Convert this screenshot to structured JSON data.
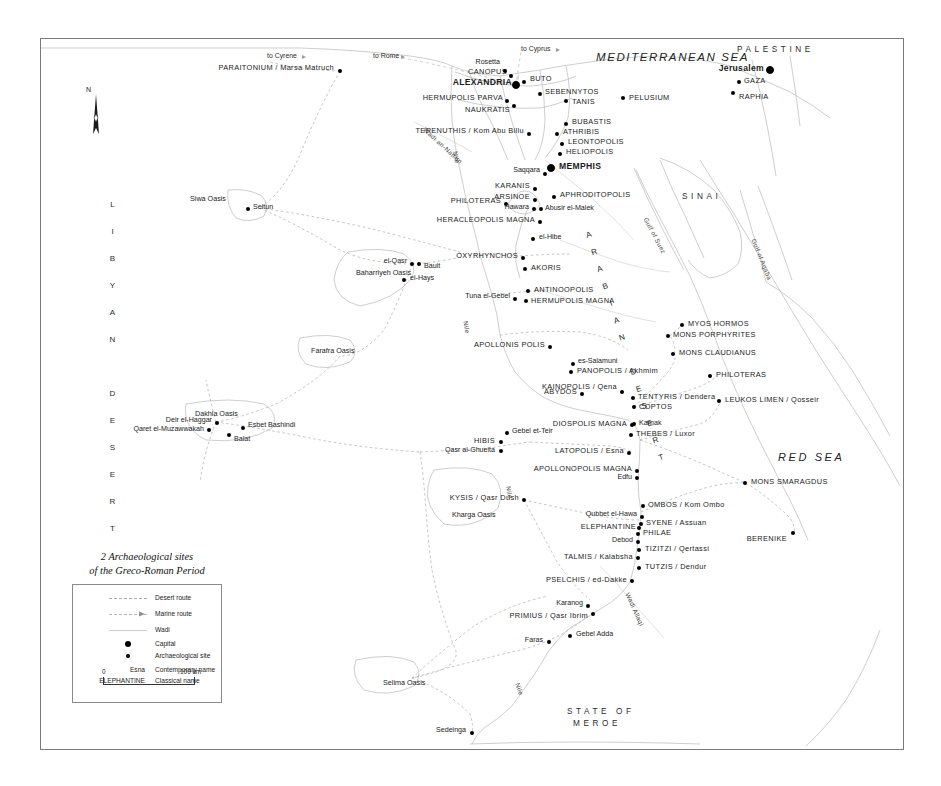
{
  "legend": {
    "title_line1": "2 Archaeological sites",
    "title_line2": "of the Greco-Roman Period",
    "items": [
      {
        "symbol": "dashed-line",
        "label": "Desert route"
      },
      {
        "symbol": "arrow-line",
        "label": "Marine route"
      },
      {
        "symbol": "thin-line",
        "label": "Wadi"
      },
      {
        "symbol": "large-dot",
        "label": "Capital"
      },
      {
        "symbol": "small-dot",
        "label": "Archaeological site"
      }
    ],
    "name_examples": [
      {
        "sample": "Esna",
        "label": "Contemporary name"
      },
      {
        "sample": "ELEPHANTINE",
        "label": "Classical name"
      }
    ],
    "scale": {
      "start": "0",
      "end": "100 km"
    }
  },
  "compass": {
    "north_label": "N"
  },
  "seas": [
    {
      "name": "MEDITERRANEAN SEA",
      "x": 596,
      "y": 52,
      "cls": "sea"
    },
    {
      "name": "RED SEA",
      "x": 778,
      "y": 452,
      "cls": "redsea"
    }
  ],
  "regions": [
    {
      "name": "LIBYAN DESERT",
      "x": 108,
      "y": 200,
      "orientation": "vertical"
    },
    {
      "name": "ARABIAN DESERT",
      "x": 583,
      "y": 232,
      "orientation": "diagonal"
    },
    {
      "name": "SINAI",
      "x": 682,
      "y": 193,
      "orientation": "horizontal"
    },
    {
      "name": "PALESTINE",
      "x": 737,
      "y": 46,
      "orientation": "horizontal"
    },
    {
      "name": "STATE OF",
      "x": 567,
      "y": 708,
      "orientation": "horizontal"
    },
    {
      "name": "MEROE",
      "x": 573,
      "y": 720,
      "orientation": "horizontal"
    }
  ],
  "gulfs": [
    {
      "name": "Gulf of Suez",
      "x": 645,
      "y": 215,
      "rot": 62
    },
    {
      "name": "Gulf of Aqaba",
      "x": 753,
      "y": 236,
      "rot": 68
    }
  ],
  "rivers": [
    {
      "name": "Nile",
      "x": 455,
      "y": 148,
      "rot": 82
    },
    {
      "name": "Nile",
      "x": 465,
      "y": 318,
      "rot": 80
    },
    {
      "name": "Nile",
      "x": 508,
      "y": 483,
      "rot": 82
    },
    {
      "name": "Nile",
      "x": 517,
      "y": 680,
      "rot": 72
    },
    {
      "name": "Wadi Allaqi",
      "x": 627,
      "y": 590,
      "rot": 66
    },
    {
      "name": "Wadi an-Natrun",
      "x": 424,
      "y": 126,
      "rot": 42
    }
  ],
  "routes": [
    {
      "label": "to Cyrene",
      "x": 267,
      "y": 53
    },
    {
      "label": "to Rome",
      "x": 373,
      "y": 53
    },
    {
      "label": "to Cyprus",
      "x": 521,
      "y": 46
    }
  ],
  "oases": [
    {
      "label": "Siwa Oasis",
      "x": 190,
      "y": 195
    },
    {
      "label": "Baharriyeh Oasis",
      "x": 356,
      "y": 269
    },
    {
      "label": "Farafra Oasis",
      "x": 311,
      "y": 347
    },
    {
      "label": "Dakhla Oasis",
      "x": 195,
      "y": 410
    },
    {
      "label": "Kharga Oasis",
      "x": 452,
      "y": 511
    },
    {
      "label": "Selima Oasis",
      "x": 383,
      "y": 679
    }
  ],
  "places": [
    {
      "name": "PARAITONIUM / Marsa Matruch",
      "cls": "classical",
      "anchor": "right",
      "tx": 334,
      "ty": 68,
      "dx": 340,
      "dy": 71,
      "size": "small"
    },
    {
      "name": "ALEXANDRIA",
      "cls": "capital",
      "anchor": "right",
      "tx": 512,
      "ty": 82,
      "dx": 516,
      "dy": 85,
      "size": "big"
    },
    {
      "name": "CANOPUS",
      "cls": "classical",
      "anchor": "right",
      "tx": 507,
      "ty": 72,
      "dx": 511,
      "dy": 76,
      "size": "small"
    },
    {
      "name": "Rosetta",
      "cls": "modern",
      "anchor": "right",
      "tx": 500,
      "ty": 63,
      "dx": 505,
      "dy": 71,
      "size": "small"
    },
    {
      "name": "BUTO",
      "cls": "classical",
      "anchor": "left",
      "tx": 530,
      "ty": 79,
      "dx": 524,
      "dy": 82,
      "size": "small"
    },
    {
      "name": "HERMUPOLIS PARVA",
      "cls": "classical",
      "anchor": "right",
      "tx": 503,
      "ty": 98,
      "dx": 507,
      "dy": 101,
      "size": "small"
    },
    {
      "name": "NAUKRATIS",
      "cls": "classical",
      "anchor": "right",
      "tx": 510,
      "ty": 110,
      "dx": 514,
      "dy": 106,
      "size": "small"
    },
    {
      "name": "SEBENNYTOS",
      "cls": "classical",
      "anchor": "left",
      "tx": 545,
      "ty": 92,
      "dx": 540,
      "dy": 94,
      "size": "small"
    },
    {
      "name": "TANIS",
      "cls": "classical",
      "anchor": "left",
      "tx": 572,
      "ty": 102,
      "dx": 566,
      "dy": 101,
      "size": "small"
    },
    {
      "name": "PELUSIUM",
      "cls": "classical",
      "anchor": "left",
      "tx": 629,
      "ty": 98,
      "dx": 623,
      "dy": 98,
      "size": "small"
    },
    {
      "name": "GAZA",
      "cls": "classical",
      "anchor": "left",
      "tx": 744,
      "ty": 81,
      "dx": 739,
      "dy": 82,
      "size": "small"
    },
    {
      "name": "RAPHIA",
      "cls": "classical",
      "anchor": "left",
      "tx": 739,
      "ty": 97,
      "dx": 733,
      "dy": 93,
      "size": "small"
    },
    {
      "name": "Jerusalem",
      "cls": "capital",
      "anchor": "right",
      "tx": 764,
      "ty": 68,
      "dx": 770,
      "dy": 70,
      "size": "big"
    },
    {
      "name": "BUBASTIS",
      "cls": "classical",
      "anchor": "left",
      "tx": 572,
      "ty": 122,
      "dx": 566,
      "dy": 124,
      "size": "small"
    },
    {
      "name": "ATHRIBIS",
      "cls": "classical",
      "anchor": "left",
      "tx": 563,
      "ty": 132,
      "dx": 557,
      "dy": 134,
      "size": "small"
    },
    {
      "name": "LEONTOPOLIS",
      "cls": "classical",
      "anchor": "left",
      "tx": 568,
      "ty": 142,
      "dx": 562,
      "dy": 144,
      "size": "small"
    },
    {
      "name": "HELIOPOLIS",
      "cls": "classical",
      "anchor": "left",
      "tx": 566,
      "ty": 152,
      "dx": 560,
      "dy": 154,
      "size": "small"
    },
    {
      "name": "TERENUTHIS / Kom Abu Billu",
      "cls": "classical",
      "anchor": "right",
      "tx": 524,
      "ty": 131,
      "dx": 529,
      "dy": 134,
      "size": "small"
    },
    {
      "name": "MEMPHIS",
      "cls": "capital",
      "anchor": "left",
      "tx": 559,
      "ty": 166,
      "dx": 551,
      "dy": 168,
      "size": "big"
    },
    {
      "name": "Saqqara",
      "cls": "modern",
      "anchor": "right",
      "tx": 540,
      "ty": 171,
      "dx": 545,
      "dy": 174,
      "size": "small"
    },
    {
      "name": "KARANIS",
      "cls": "classical",
      "anchor": "right",
      "tx": 530,
      "ty": 186,
      "dx": 535,
      "dy": 189,
      "size": "small"
    },
    {
      "name": "APHRODITOPOLIS",
      "cls": "classical",
      "anchor": "left",
      "tx": 560,
      "ty": 195,
      "dx": 554,
      "dy": 197,
      "size": "small"
    },
    {
      "name": "ARSINOE",
      "cls": "classical",
      "anchor": "right",
      "tx": 530,
      "ty": 197,
      "dx": 535,
      "dy": 200,
      "size": "small"
    },
    {
      "name": "PHILOTERAS",
      "cls": "classical",
      "anchor": "right",
      "tx": 501,
      "ty": 201,
      "dx": 506,
      "dy": 204,
      "size": "small"
    },
    {
      "name": "Hawara",
      "cls": "modern",
      "anchor": "right",
      "tx": 529,
      "ty": 208,
      "dx": 534,
      "dy": 209,
      "size": "small"
    },
    {
      "name": "Abusir el-Malek",
      "cls": "modern",
      "anchor": "left",
      "tx": 545,
      "ty": 209,
      "dx": 541,
      "dy": 209,
      "size": "small"
    },
    {
      "name": "HERACLEOPOLIS MAGNA",
      "cls": "classical",
      "anchor": "right",
      "tx": 535,
      "ty": 220,
      "dx": 540,
      "dy": 222,
      "size": "small"
    },
    {
      "name": "el-Hibe",
      "cls": "modern",
      "anchor": "left",
      "tx": 539,
      "ty": 238,
      "dx": 533,
      "dy": 239,
      "size": "small"
    },
    {
      "name": "OXYRHYNCHOS",
      "cls": "classical",
      "anchor": "right",
      "tx": 518,
      "ty": 256,
      "dx": 523,
      "dy": 258,
      "size": "small"
    },
    {
      "name": "AKORIS",
      "cls": "classical",
      "anchor": "left",
      "tx": 531,
      "ty": 268,
      "dx": 525,
      "dy": 269,
      "size": "small"
    },
    {
      "name": "ANTINOOPOLIS",
      "cls": "classical",
      "anchor": "left",
      "tx": 534,
      "ty": 290,
      "dx": 528,
      "dy": 291,
      "size": "small"
    },
    {
      "name": "HERMUPOLIS MAGNA",
      "cls": "classical",
      "anchor": "left",
      "tx": 531,
      "ty": 301,
      "dx": 526,
      "dy": 301,
      "size": "small"
    },
    {
      "name": "Tuna el-Gebel",
      "cls": "modern",
      "anchor": "right",
      "tx": 510,
      "ty": 297,
      "dx": 515,
      "dy": 299,
      "size": "small"
    },
    {
      "name": "el-Qasr",
      "cls": "modern",
      "anchor": "right",
      "tx": 407,
      "ty": 262,
      "dx": 412,
      "dy": 264,
      "size": "small"
    },
    {
      "name": "Bauit",
      "cls": "modern",
      "anchor": "left",
      "tx": 424,
      "ty": 267,
      "dx": 419,
      "dy": 264,
      "size": "small"
    },
    {
      "name": "el-Hays",
      "cls": "modern",
      "anchor": "left",
      "tx": 410,
      "ty": 279,
      "dx": 404,
      "dy": 280,
      "size": "small"
    },
    {
      "name": "APOLLONIS POLIS",
      "cls": "classical",
      "anchor": "right",
      "tx": 545,
      "ty": 345,
      "dx": 550,
      "dy": 347,
      "size": "small"
    },
    {
      "name": "es-Salamuni",
      "cls": "modern",
      "anchor": "left",
      "tx": 578,
      "ty": 362,
      "dx": 573,
      "dy": 364,
      "size": "small"
    },
    {
      "name": "PANOPOLIS / Akhmim",
      "cls": "classical",
      "anchor": "left",
      "tx": 577,
      "ty": 371,
      "dx": 571,
      "dy": 372,
      "size": "small"
    },
    {
      "name": "ABYDOS",
      "cls": "classical",
      "anchor": "right",
      "tx": 577,
      "ty": 392,
      "dx": 582,
      "dy": 394,
      "size": "small"
    },
    {
      "name": "KAINOPOLIS / Qena",
      "cls": "classical",
      "anchor": "right",
      "tx": 617,
      "ty": 387,
      "dx": 622,
      "dy": 392,
      "size": "small"
    },
    {
      "name": "TENTYRIS / Dendera",
      "cls": "classical",
      "anchor": "left",
      "tx": 638,
      "ty": 397,
      "dx": 633,
      "dy": 398,
      "size": "small"
    },
    {
      "name": "COPTOS",
      "cls": "classical",
      "anchor": "left",
      "tx": 639,
      "ty": 407,
      "dx": 634,
      "dy": 407,
      "size": "small"
    },
    {
      "name": "DIOSPOLIS MAGNA",
      "cls": "classical",
      "anchor": "right",
      "tx": 627,
      "ty": 424,
      "dx": 632,
      "dy": 425,
      "size": "small"
    },
    {
      "name": "Karnak",
      "cls": "modern",
      "anchor": "left",
      "tx": 639,
      "ty": 424,
      "dx": 634,
      "dy": 424,
      "size": "small"
    },
    {
      "name": "THEBES / Luxor",
      "cls": "classical",
      "anchor": "left",
      "tx": 636,
      "ty": 434,
      "dx": 631,
      "dy": 435,
      "size": "small"
    },
    {
      "name": "LATOPOLIS / Esna",
      "cls": "classical",
      "anchor": "right",
      "tx": 624,
      "ty": 451,
      "dx": 629,
      "dy": 453,
      "size": "small"
    },
    {
      "name": "APOLLONOPOLIS MAGNA",
      "cls": "classical",
      "anchor": "right",
      "tx": 632,
      "ty": 469,
      "dx": 637,
      "dy": 471,
      "size": "small"
    },
    {
      "name": "Edfu",
      "cls": "modern",
      "anchor": "right",
      "tx": 632,
      "ty": 478,
      "dx": 637,
      "dy": 478,
      "size": "small"
    },
    {
      "name": "Gebel et-Teir",
      "cls": "modern",
      "anchor": "left",
      "tx": 512,
      "ty": 432,
      "dx": 507,
      "dy": 433,
      "size": "small"
    },
    {
      "name": "HIBIS",
      "cls": "classical",
      "anchor": "right",
      "tx": 495,
      "ty": 441,
      "dx": 501,
      "dy": 442,
      "size": "small"
    },
    {
      "name": "Qasr al-Ghueita",
      "cls": "modern",
      "anchor": "right",
      "tx": 495,
      "ty": 451,
      "dx": 501,
      "dy": 451,
      "size": "small"
    },
    {
      "name": "KYSIS / Qasr Dush",
      "cls": "classical",
      "anchor": "right",
      "tx": 519,
      "ty": 498,
      "dx": 524,
      "dy": 500,
      "size": "small"
    },
    {
      "name": "Deir el-Haggar",
      "cls": "modern",
      "anchor": "right",
      "tx": 212,
      "ty": 421,
      "dx": 217,
      "dy": 423,
      "size": "small"
    },
    {
      "name": "Qaret el-Muzawwakah",
      "cls": "modern",
      "anchor": "right",
      "tx": 204,
      "ty": 430,
      "dx": 209,
      "dy": 430,
      "size": "small"
    },
    {
      "name": "Esbet Bashindi",
      "cls": "modern",
      "anchor": "left",
      "tx": 248,
      "ty": 426,
      "dx": 243,
      "dy": 428,
      "size": "small"
    },
    {
      "name": "Balat",
      "cls": "modern",
      "anchor": "left",
      "tx": 234,
      "ty": 440,
      "dx": 229,
      "dy": 435,
      "size": "small"
    },
    {
      "name": "Seitun",
      "cls": "modern",
      "anchor": "left",
      "tx": 253,
      "ty": 208,
      "dx": 248,
      "dy": 209,
      "size": "small"
    },
    {
      "name": "MYOS HORMOS",
      "cls": "classical",
      "anchor": "left",
      "tx": 688,
      "ty": 324,
      "dx": 682,
      "dy": 325,
      "size": "small"
    },
    {
      "name": "MONS PORPHYRITES",
      "cls": "classical",
      "anchor": "left",
      "tx": 673,
      "ty": 335,
      "dx": 668,
      "dy": 336,
      "size": "small"
    },
    {
      "name": "MONS CLAUDIANUS",
      "cls": "classical",
      "anchor": "left",
      "tx": 679,
      "ty": 353,
      "dx": 673,
      "dy": 354,
      "size": "small"
    },
    {
      "name": "PHILOTERAS",
      "cls": "classical",
      "anchor": "left",
      "tx": 716,
      "ty": 375,
      "dx": 710,
      "dy": 376,
      "size": "small"
    },
    {
      "name": "LEUKOS LIMEN / Qosseir",
      "cls": "classical",
      "anchor": "left",
      "tx": 725,
      "ty": 400,
      "dx": 719,
      "dy": 401,
      "size": "small"
    },
    {
      "name": "MONS SMARAGDUS",
      "cls": "classical",
      "anchor": "left",
      "tx": 751,
      "ty": 482,
      "dx": 745,
      "dy": 483,
      "size": "small"
    },
    {
      "name": "BERENIKE",
      "cls": "classical",
      "anchor": "right",
      "tx": 787,
      "ty": 539,
      "dx": 793,
      "dy": 533,
      "size": "small"
    },
    {
      "name": "OMBOS / Kom Ombo",
      "cls": "classical",
      "anchor": "left",
      "tx": 648,
      "ty": 505,
      "dx": 643,
      "dy": 506,
      "size": "small"
    },
    {
      "name": "Qubbet el-Hawa",
      "cls": "modern",
      "anchor": "right",
      "tx": 637,
      "ty": 515,
      "dx": 642,
      "dy": 517,
      "size": "small"
    },
    {
      "name": "SYENE / Assuan",
      "cls": "classical",
      "anchor": "left",
      "tx": 646,
      "ty": 523,
      "dx": 641,
      "dy": 524,
      "size": "small"
    },
    {
      "name": "ELEPHANTINE",
      "cls": "classical",
      "anchor": "right",
      "tx": 636,
      "ty": 527,
      "dx": 639,
      "dy": 528,
      "size": "small"
    },
    {
      "name": "PHILAE",
      "cls": "classical",
      "anchor": "left",
      "tx": 643,
      "ty": 533,
      "dx": 638,
      "dy": 534,
      "size": "small"
    },
    {
      "name": "Debod",
      "cls": "modern",
      "anchor": "right",
      "tx": 633,
      "ty": 541,
      "dx": 638,
      "dy": 542,
      "size": "small"
    },
    {
      "name": "TIZITZI / Qertassi",
      "cls": "classical",
      "anchor": "left",
      "tx": 645,
      "ty": 549,
      "dx": 639,
      "dy": 550,
      "size": "small"
    },
    {
      "name": "TALMIS / Kalabsha",
      "cls": "classical",
      "anchor": "right",
      "tx": 633,
      "ty": 557,
      "dx": 638,
      "dy": 558,
      "size": "small"
    },
    {
      "name": "TUTZIS / Dendur",
      "cls": "classical",
      "anchor": "left",
      "tx": 645,
      "ty": 567,
      "dx": 639,
      "dy": 568,
      "size": "small"
    },
    {
      "name": "PSELCHIS / ed-Dakke",
      "cls": "classical",
      "anchor": "right",
      "tx": 627,
      "ty": 580,
      "dx": 632,
      "dy": 581,
      "size": "small"
    },
    {
      "name": "Karanog",
      "cls": "modern",
      "anchor": "right",
      "tx": 583,
      "ty": 604,
      "dx": 588,
      "dy": 606,
      "size": "small"
    },
    {
      "name": "PRIMIUS / Qasr Ibrim",
      "cls": "classical",
      "anchor": "right",
      "tx": 588,
      "ty": 616,
      "dx": 593,
      "dy": 614,
      "size": "small"
    },
    {
      "name": "Faras",
      "cls": "modern",
      "anchor": "right",
      "tx": 543,
      "ty": 641,
      "dx": 549,
      "dy": 642,
      "size": "small"
    },
    {
      "name": "Gebel Adda",
      "cls": "modern",
      "anchor": "left",
      "tx": 576,
      "ty": 635,
      "dx": 570,
      "dy": 636,
      "size": "small"
    },
    {
      "name": "Sedeinga",
      "cls": "modern",
      "anchor": "right",
      "tx": 466,
      "ty": 731,
      "dx": 472,
      "dy": 733,
      "size": "small"
    }
  ]
}
